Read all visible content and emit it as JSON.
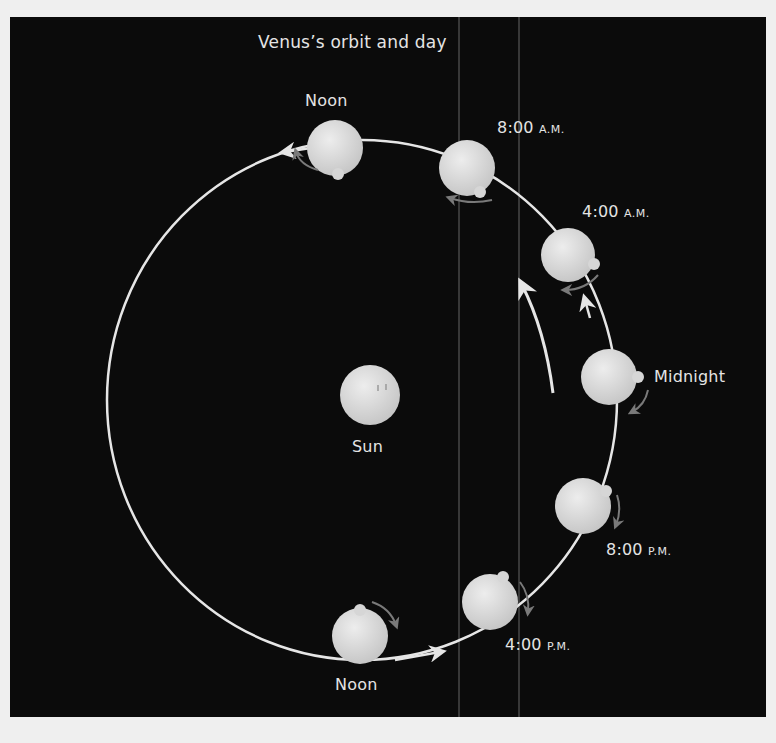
{
  "diagram": {
    "title": "Venus’s orbit and day",
    "center_label": "Sun",
    "colors": {
      "background": "#0b0b0b",
      "page": "#efefef",
      "orbit": "#e6e6e6",
      "planet": "#d9d9d9",
      "rotation_arrow": "#7a7a7a",
      "text": "#e4e4e4"
    },
    "positions": [
      {
        "id": "noon-top",
        "time": "Noon",
        "suffix": ""
      },
      {
        "id": "8am",
        "time": "8:00",
        "suffix": "A.M."
      },
      {
        "id": "4am",
        "time": "4:00",
        "suffix": "A.M."
      },
      {
        "id": "midnight",
        "time": "Midnight",
        "suffix": ""
      },
      {
        "id": "8pm",
        "time": "8:00",
        "suffix": "P.M."
      },
      {
        "id": "4pm",
        "time": "4:00",
        "suffix": "P.M."
      },
      {
        "id": "noon-bottom",
        "time": "Noon",
        "suffix": ""
      }
    ],
    "notes": {
      "orbit_direction": "counterclockwise",
      "rotation_direction": "clockwise (retrograde)"
    }
  }
}
